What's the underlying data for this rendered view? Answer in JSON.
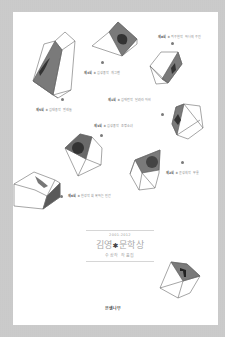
{
  "book": {
    "years": "2001-2012",
    "title_part1": "김영",
    "title_star": "✱",
    "title_part2": "문학상",
    "subtitle": "수상작 작품집",
    "publisher": "은행나무"
  },
  "captions": [
    {
      "no": "제8회",
      "text": "✱ 최우현작 하나의 우진"
    },
    {
      "no": "제4회",
      "text": "✱ 김성중작 개그맨"
    },
    {
      "no": "제5회",
      "text": "✱ 김태용작 벌레들"
    },
    {
      "no": "제1회",
      "text": "✱ 김애란작 달려라 아비"
    },
    {
      "no": "제3회",
      "text": "✱ 김성중작 조명소녀"
    },
    {
      "no": "제2회",
      "text": "✱ 윤성희작 무릎"
    },
    {
      "no": "제6회",
      "text": "✱ 한강작 회복하는 인간"
    }
  ],
  "colors": {
    "frame": "#c9c9c9",
    "cover": "#ffffff",
    "shade": "#6e6e6e",
    "outline": "#555555"
  }
}
